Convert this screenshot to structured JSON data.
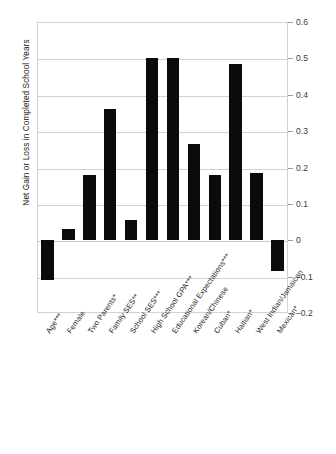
{
  "chart_data": {
    "type": "bar",
    "title": "",
    "xlabel": "",
    "ylabel": "Net Gain or Loss in Completed School Years",
    "ylim": [
      -0.2,
      0.6
    ],
    "ytick_values": [
      0.6,
      0.5,
      0.4,
      0.3,
      0.2,
      0.1,
      0,
      -0.1,
      -0.2
    ],
    "ytick_labels": [
      "0.6",
      "0.5",
      "0.4",
      "0.3",
      "0.2",
      "0.1",
      "0",
      "–0.1",
      "–0.2"
    ],
    "grid": true,
    "legend": "none",
    "axis_position": "right",
    "bar_color": "#0b0b0b",
    "categories": [
      "Age***",
      "Female",
      "Two Parents*",
      "Family SES**",
      "School SES***",
      "High School GPA***",
      "Educational Expectations***",
      "Korean/Chinese",
      "Cuban*",
      "Haitian*",
      "West Indian/Jamaican",
      "Mexican*"
    ],
    "values": [
      -0.11,
      0.03,
      0.18,
      0.36,
      0.055,
      0.5,
      0.5,
      0.265,
      0.18,
      0.485,
      0.185,
      -0.085
    ]
  }
}
